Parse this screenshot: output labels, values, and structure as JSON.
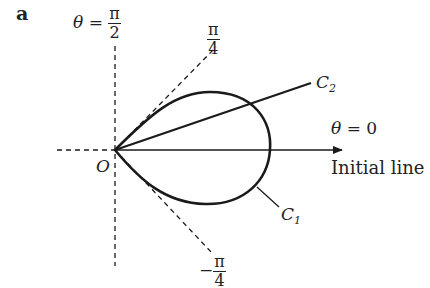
{
  "figure": {
    "part_label": "a",
    "origin_label": "O",
    "initial_line_label": "Initial line",
    "theta_symbol": "θ",
    "equals": "=",
    "half_pi": {
      "num": "π",
      "den": "2"
    },
    "zero_label": "0",
    "quarter_pi": {
      "num": "π",
      "den": "4"
    },
    "neg_quarter_pi": {
      "sign": "−",
      "num": "π",
      "den": "4"
    },
    "curve1": {
      "name": "C",
      "sub": "1"
    },
    "curve2": {
      "name": "C",
      "sub": "2"
    },
    "colors": {
      "stroke": "#1a1a1a"
    }
  }
}
